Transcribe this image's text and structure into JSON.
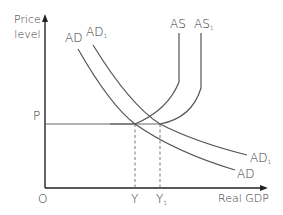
{
  "diagram": {
    "type": "AD-AS model",
    "y_axis_label_line1": "Price",
    "y_axis_label_line2": "level",
    "x_axis_label": "Real GDP",
    "origin_label": "O",
    "price_label": "P",
    "output_label": "Y",
    "output_label_new": "Y",
    "output_label_new_sub": "1",
    "curves": {
      "ad": "AD",
      "ad1": "AD",
      "ad1_sub": "1",
      "as": "AS",
      "as1": "AS",
      "as1_sub": "1"
    },
    "colors": {
      "axis": "#222222",
      "curve": "#555555",
      "dashed": "#777777",
      "text": "#333333"
    }
  }
}
